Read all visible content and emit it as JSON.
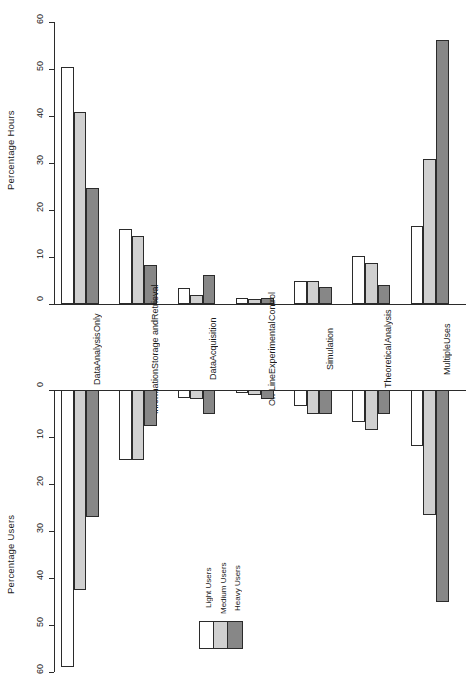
{
  "chart_data": {
    "type": "bar",
    "title": "",
    "orientation": "rotated-90-two-panel",
    "categories": [
      "Data\nAnalysis\nOnly",
      "Information\nStorage and\nRetrieval",
      "Data\nAcquisition",
      "On-Line\nExperimental\nControl",
      "Simulation",
      "Theoretical\nAnalysis",
      "Multiple\nUses"
    ],
    "category_labels": [
      [
        "Data",
        "Analysis",
        "Only"
      ],
      [
        "Information",
        "Storage and",
        "Retrieval"
      ],
      [
        "Data",
        "Acquisition"
      ],
      [
        "On-Line",
        "Experimental",
        "Control"
      ],
      [
        "Simulation"
      ],
      [
        "Theoretical",
        "Analysis"
      ],
      [
        "Multiple",
        "Uses"
      ]
    ],
    "legend": {
      "position": "bottom-center",
      "entries": [
        {
          "name": "Light Users",
          "color": "#ffffff"
        },
        {
          "name": "Medium Users",
          "color": "#d0d0d0"
        },
        {
          "name": "Heavy Users",
          "color": "#878787"
        }
      ]
    },
    "panels": [
      {
        "id": "percentage-hours",
        "ylabel": "Percentage Hours",
        "ylim": [
          0,
          60
        ],
        "yticks": [
          0,
          10,
          20,
          30,
          40,
          50,
          60
        ],
        "ytick_labels": [
          "0",
          "10",
          "20",
          "30",
          "40",
          "50",
          "60"
        ],
        "direction": "up",
        "grid": false,
        "series": [
          {
            "name": "Light Users",
            "color": "#ffffff",
            "values": [
              50.5,
              16.0,
              3.5,
              1.2,
              4.8,
              10.2,
              16.5
            ]
          },
          {
            "name": "Medium Users",
            "color": "#d0d0d0",
            "values": [
              40.8,
              14.4,
              2.0,
              1.1,
              4.9,
              8.8,
              30.8
            ]
          },
          {
            "name": "Heavy Users",
            "color": "#878787",
            "values": [
              24.6,
              8.3,
              6.2,
              1.2,
              3.7,
              4.0,
              56.2
            ]
          }
        ]
      },
      {
        "id": "percentage-users",
        "ylabel": "Percentage Users",
        "ylim": [
          0,
          60
        ],
        "yticks": [
          0,
          10,
          20,
          30,
          40,
          50,
          60
        ],
        "ytick_labels": [
          "0",
          "10",
          "20",
          "30",
          "40",
          "50",
          "60"
        ],
        "direction": "down",
        "grid": false,
        "series": [
          {
            "name": "Light Users",
            "color": "#ffffff",
            "values": [
              59.0,
              14.8,
              1.8,
              0.7,
              3.4,
              6.8,
              12.0
            ]
          },
          {
            "name": "Medium Users",
            "color": "#d0d0d0",
            "values": [
              42.5,
              14.8,
              2.0,
              1.0,
              5.2,
              8.6,
              26.5
            ]
          },
          {
            "name": "Heavy Users",
            "color": "#878787",
            "values": [
              27.0,
              7.6,
              5.0,
              2.0,
              5.0,
              5.0,
              45.0
            ]
          }
        ]
      }
    ]
  }
}
